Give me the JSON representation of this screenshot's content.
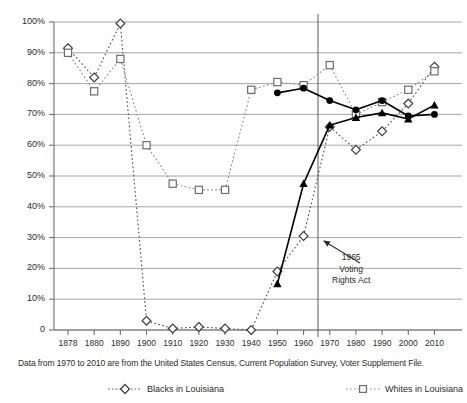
{
  "chart_data": {
    "type": "line",
    "title": "",
    "xlabel": "",
    "ylabel": "",
    "ylim": [
      0,
      100
    ],
    "ytick_labels": [
      "0",
      "10%",
      "20%",
      "30%",
      "40%",
      "50%",
      "60%",
      "70%",
      "80%",
      "90%",
      "100%"
    ],
    "ytick_values": [
      0,
      10,
      20,
      30,
      40,
      50,
      60,
      70,
      80,
      90,
      100
    ],
    "grid": "horizontal",
    "legend_position": "below-plot",
    "categories": [
      "1878",
      "1880",
      "1890",
      "1900",
      "1910",
      "1920",
      "1930",
      "1940",
      "1950",
      "1960",
      "1970",
      "1980",
      "1990",
      "2000",
      "2010"
    ],
    "series": [
      {
        "name": "Blacks in Louisiana",
        "marker": "open-diamond",
        "line_style": "dotted",
        "color": "#555555",
        "values": [
          91.5,
          82,
          99.5,
          3,
          0.5,
          1,
          0.5,
          0,
          19,
          30.5,
          66,
          58.5,
          64.5,
          73.5,
          85.5
        ]
      },
      {
        "name": "Whites in Louisiana",
        "marker": "open-square",
        "line_style": "dotted",
        "color": "#8a8a8a",
        "values": [
          90,
          77.5,
          88,
          60,
          47.5,
          45.5,
          45.5,
          78,
          80.5,
          79.5,
          86,
          70,
          74,
          78,
          84
        ]
      },
      {
        "name": "series-solid-circle",
        "marker": "filled-circle",
        "line_style": "solid",
        "color": "#000000",
        "values": [
          null,
          null,
          null,
          null,
          null,
          null,
          null,
          null,
          77,
          78.5,
          74.5,
          71.5,
          74.5,
          69.5,
          70
        ]
      },
      {
        "name": "series-solid-triangle",
        "marker": "filled-triangle",
        "line_style": "solid",
        "color": "#000000",
        "values": [
          null,
          null,
          null,
          null,
          null,
          null,
          null,
          null,
          15,
          47.5,
          66.5,
          69,
          70.5,
          68.5,
          73
        ]
      }
    ],
    "annotations": [
      {
        "name": "voting-rights-act",
        "lines": [
          "1965",
          "Voting",
          "Rights Act"
        ],
        "points_to_year": 1965,
        "marker": "vertical-line-with-arrow"
      }
    ],
    "vertical_rule_year": "1965",
    "caption": "Data from 1970 to 2010 are from the United States Census, Current Population Survey, Voter Supplement File."
  },
  "legend": {
    "items": [
      {
        "label": "Blacks in Louisiana",
        "icon": "open-diamond-dotted-icon"
      },
      {
        "label": "Whites in Louisiana",
        "icon": "open-square-dotted-icon"
      }
    ]
  },
  "annotation": {
    "line1": "1965",
    "line2": "Voting",
    "line3": "Rights Act"
  },
  "caption": {
    "text": "Data from 1970 to 2010 are from the United States Census, Current Population Survey, Voter Supplement File."
  },
  "colors": {
    "blacks_series": "#555555",
    "whites_series": "#8a8a8a",
    "solid_series": "#000000",
    "gridline": "#9a9a9a",
    "axis": "#6f6f6f",
    "text": "#2b2b2b",
    "background": "#ffffff"
  }
}
